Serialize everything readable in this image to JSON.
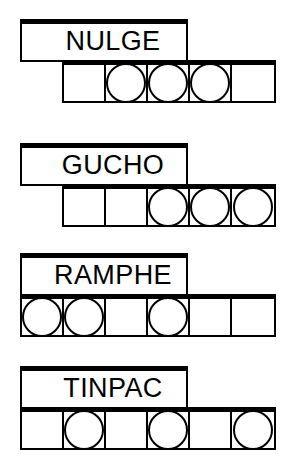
{
  "sheet": {
    "title": "word puzzle worksheet",
    "background_color": "#ffffff",
    "line_color": "#000000"
  },
  "groups": [
    {
      "id": "group-nulge",
      "label": "NULGE",
      "top": 19,
      "cells_left": 62,
      "cells": [
        {
          "circle": false
        },
        {
          "circle": true
        },
        {
          "circle": true
        },
        {
          "circle": true
        },
        {
          "circle": false
        }
      ]
    },
    {
      "id": "group-gucho",
      "label": "GUCHO",
      "top": 143,
      "cells_left": 62,
      "cells": [
        {
          "circle": false
        },
        {
          "circle": false
        },
        {
          "circle": true
        },
        {
          "circle": true
        },
        {
          "circle": true
        }
      ]
    },
    {
      "id": "group-ramphe",
      "label": "RAMPHE",
      "top": 253,
      "cells_left": 20,
      "cells": [
        {
          "circle": true
        },
        {
          "circle": true
        },
        {
          "circle": false
        },
        {
          "circle": true
        },
        {
          "circle": false
        },
        {
          "circle": false
        }
      ]
    },
    {
      "id": "group-tinpac",
      "label": "TINPAC",
      "top": 366,
      "cells_left": 20,
      "cells": [
        {
          "circle": false
        },
        {
          "circle": true
        },
        {
          "circle": false
        },
        {
          "circle": true
        },
        {
          "circle": false
        },
        {
          "circle": true
        }
      ]
    }
  ]
}
